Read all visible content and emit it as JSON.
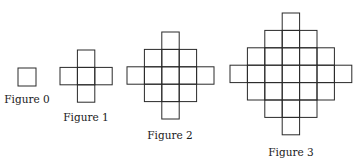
{
  "figures": [
    {
      "label": "Figure 0",
      "n": 0,
      "cell_size": 18,
      "origin": [
        18,
        68
      ],
      "rows": [
        [
          0,
          1
        ]
      ],
      "label_pos": [
        27,
        103
      ]
    },
    {
      "label": "Figure 1",
      "n": 1,
      "cell_size": 17.4,
      "origin": [
        60,
        50
      ],
      "rows": [
        [
          1,
          2
        ],
        [
          0,
          3
        ],
        [
          1,
          2
        ]
      ],
      "label_pos": [
        86,
        121
      ]
    },
    {
      "label": "Figure 2",
      "n": 2,
      "cell_size": 17.4,
      "origin": [
        127,
        32
      ],
      "rows": [
        [
          2,
          3
        ],
        [
          1,
          4
        ],
        [
          0,
          5
        ],
        [
          1,
          4
        ],
        [
          2,
          3
        ]
      ],
      "label_pos": [
        170,
        139
      ]
    },
    {
      "label": "Figure 3",
      "n": 3,
      "cell_size": 17.4,
      "origin": [
        230,
        13
      ],
      "rows": [
        [
          3,
          4
        ],
        [
          2,
          5
        ],
        [
          1,
          6
        ],
        [
          0,
          7
        ],
        [
          1,
          6
        ],
        [
          2,
          5
        ],
        [
          3,
          4
        ]
      ],
      "label_pos": [
        291,
        156
      ]
    }
  ],
  "colors": {
    "stroke": "#2a2a2a",
    "text": "#1a1a1a",
    "background": "#ffffff"
  }
}
